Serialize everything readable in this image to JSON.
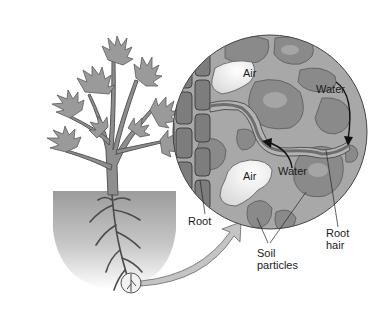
{
  "figure": {
    "labels": {
      "air_top": "Air",
      "air_bottom": "Air",
      "water_right": "Water",
      "water_bottom": "Water",
      "root": "Root",
      "root_hair_line1": "Root",
      "root_hair_line2": "hair",
      "soil_line1": "Soil",
      "soil_line2": "particles"
    },
    "colors": {
      "background": "#ffffff",
      "leaf_fill": "#9a9a9a",
      "leaf_stroke": "#555555",
      "soil_gradient_top": "#9c9c9c",
      "soil_gradient_bottom": "#ffffff",
      "circle_bg": "#a8a8a8",
      "soil_particle": "#8a8a8a",
      "air_pocket": "#ececec",
      "root_cell": "#7d7d7d",
      "root_hair": "#6e6e6e",
      "water_film": "#b4b4b4",
      "arrow_fill": "#c4c4c4",
      "text": "#1a1a1a"
    }
  }
}
